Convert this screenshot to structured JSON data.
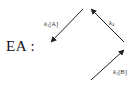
{
  "diagram": {
    "species_label": "EA :",
    "arrows": [
      {
        "id": "k1A",
        "from": [
          83,
          9
        ],
        "to": [
          51,
          42
        ],
        "label": {
          "symbol": "k",
          "subscript": "1",
          "concentration": "[A]"
        }
      },
      {
        "id": "k4",
        "from": [
          124,
          42
        ],
        "to": [
          91,
          9
        ],
        "label": {
          "symbol": "k",
          "subscript": "4",
          "concentration": ""
        }
      },
      {
        "id": "k1B",
        "from": [
          91,
          80
        ],
        "to": [
          124,
          50
        ],
        "label": {
          "symbol": "k",
          "subscript": "1",
          "concentration": "[B]"
        }
      }
    ],
    "colors": {
      "line": "#222222",
      "text": "#111111",
      "background": "#ffffff"
    }
  }
}
